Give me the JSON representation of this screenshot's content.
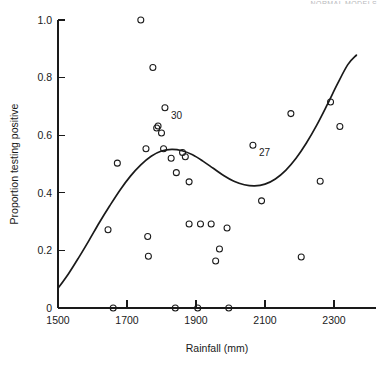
{
  "header": {
    "cropped_text": "NORMAL MODELS"
  },
  "chart_data": {
    "type": "scatter",
    "title": "",
    "xlabel": "Rainfall (mm)",
    "ylabel": "Proportion testing positive",
    "xlim": [
      1470,
      2400
    ],
    "ylim": [
      0.0,
      1.04
    ],
    "xticks": [
      1500,
      1700,
      1900,
      2100,
      2300
    ],
    "xticklabels": [
      "1500",
      "1700",
      "1900",
      "2100",
      "2300"
    ],
    "yticks": [
      0,
      0.2,
      0.4,
      0.6,
      0.8,
      1.0
    ],
    "yticklabels": [
      "0",
      "0.2",
      "0.4",
      "0.6",
      "0.8",
      "1.0"
    ],
    "grid": false,
    "legend": "none",
    "marker": "open-circle",
    "points": [
      {
        "x": 1740,
        "y": 1.0
      },
      {
        "x": 1775,
        "y": 0.835
      },
      {
        "x": 1810,
        "y": 0.695
      },
      {
        "x": 1786,
        "y": 0.625
      },
      {
        "x": 1790,
        "y": 0.632
      },
      {
        "x": 1800,
        "y": 0.608
      },
      {
        "x": 2175,
        "y": 0.675
      },
      {
        "x": 2290,
        "y": 0.715
      },
      {
        "x": 2317,
        "y": 0.63
      },
      {
        "x": 2065,
        "y": 0.565
      },
      {
        "x": 1672,
        "y": 0.503
      },
      {
        "x": 1755,
        "y": 0.553
      },
      {
        "x": 1806,
        "y": 0.553
      },
      {
        "x": 1828,
        "y": 0.52
      },
      {
        "x": 1861,
        "y": 0.54
      },
      {
        "x": 1869,
        "y": 0.525
      },
      {
        "x": 1843,
        "y": 0.47
      },
      {
        "x": 1880,
        "y": 0.438
      },
      {
        "x": 2090,
        "y": 0.372
      },
      {
        "x": 2260,
        "y": 0.44
      },
      {
        "x": 1645,
        "y": 0.272
      },
      {
        "x": 1760,
        "y": 0.248
      },
      {
        "x": 1880,
        "y": 0.292
      },
      {
        "x": 1913,
        "y": 0.292
      },
      {
        "x": 1944,
        "y": 0.292
      },
      {
        "x": 1990,
        "y": 0.278
      },
      {
        "x": 1762,
        "y": 0.18
      },
      {
        "x": 1957,
        "y": 0.163
      },
      {
        "x": 1968,
        "y": 0.205
      },
      {
        "x": 2205,
        "y": 0.177
      },
      {
        "x": 1660,
        "y": 0.0
      },
      {
        "x": 1840,
        "y": 0.0
      },
      {
        "x": 1905,
        "y": 0.0
      },
      {
        "x": 1995,
        "y": 0.0
      }
    ],
    "annotations": [
      {
        "label": "30",
        "x": 1810,
        "y": 0.695
      },
      {
        "label": "27",
        "x": 2065,
        "y": 0.565
      }
    ],
    "fit_curve": {
      "name": "fitted-curve",
      "points": [
        {
          "x": 1500,
          "y": 0.068
        },
        {
          "x": 1530,
          "y": 0.118
        },
        {
          "x": 1560,
          "y": 0.175
        },
        {
          "x": 1590,
          "y": 0.235
        },
        {
          "x": 1620,
          "y": 0.297
        },
        {
          "x": 1650,
          "y": 0.355
        },
        {
          "x": 1680,
          "y": 0.41
        },
        {
          "x": 1710,
          "y": 0.458
        },
        {
          "x": 1740,
          "y": 0.497
        },
        {
          "x": 1770,
          "y": 0.527
        },
        {
          "x": 1800,
          "y": 0.545
        },
        {
          "x": 1830,
          "y": 0.551
        },
        {
          "x": 1860,
          "y": 0.546
        },
        {
          "x": 1890,
          "y": 0.532
        },
        {
          "x": 1920,
          "y": 0.51
        },
        {
          "x": 1950,
          "y": 0.485
        },
        {
          "x": 1980,
          "y": 0.46
        },
        {
          "x": 2010,
          "y": 0.44
        },
        {
          "x": 2040,
          "y": 0.428
        },
        {
          "x": 2070,
          "y": 0.424
        },
        {
          "x": 2100,
          "y": 0.43
        },
        {
          "x": 2130,
          "y": 0.448
        },
        {
          "x": 2160,
          "y": 0.478
        },
        {
          "x": 2190,
          "y": 0.52
        },
        {
          "x": 2220,
          "y": 0.573
        },
        {
          "x": 2250,
          "y": 0.635
        },
        {
          "x": 2280,
          "y": 0.705
        },
        {
          "x": 2310,
          "y": 0.778
        },
        {
          "x": 2340,
          "y": 0.845
        },
        {
          "x": 2365,
          "y": 0.878
        }
      ]
    }
  }
}
